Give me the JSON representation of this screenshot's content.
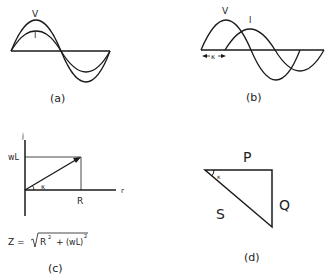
{
  "panels": {
    "a": {
      "caption": "(a)",
      "voltage_label": "V",
      "current_label": "I",
      "description": "Voltage and current sine waves in phase"
    },
    "b": {
      "caption": "(b)",
      "voltage_label": "V",
      "current_label": "I",
      "phase_label": "κ",
      "description": "Current lagging voltage by phase angle"
    },
    "c": {
      "caption": "(c)",
      "imag_axis_label": "j",
      "real_axis_label": "r",
      "reactance_label": "wL",
      "resistance_label": "R",
      "angle_label": "κ",
      "formula": {
        "lhs": "Z = ",
        "r_term": "R",
        "exp1": "2",
        "plus": "+",
        "wl_term": "(wL)",
        "exp2": "2"
      }
    },
    "d": {
      "caption": "(d)",
      "real_power_label": "P",
      "reactive_power_label": "Q",
      "apparent_power_label": "S",
      "angle_label": "κ"
    }
  },
  "colors": {
    "stroke": "#1a1a1a",
    "text": "#222222",
    "background": "#ffffff"
  }
}
